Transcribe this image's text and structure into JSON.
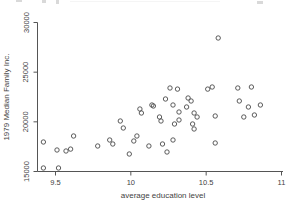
{
  "chart_data": {
    "type": "scatter",
    "title": "",
    "xlabel": "average education level",
    "ylabel": "1979 Median Family Inc.",
    "xlim": [
      9.5,
      11
    ],
    "ylim": [
      15000,
      30000
    ],
    "x_ticks": [
      9.5,
      10,
      10.5,
      11
    ],
    "x_tick_labels": [
      "9.5",
      "10",
      "10.5",
      "11"
    ],
    "y_ticks": [
      15000,
      20000,
      25000,
      30000
    ],
    "y_tick_labels": [
      "15000",
      "20000",
      "25000",
      "30000"
    ],
    "grid": false,
    "legend": null,
    "marker": "open-circle",
    "points": [
      [
        9.42,
        17970
      ],
      [
        9.42,
        15350
      ],
      [
        9.51,
        17160
      ],
      [
        9.52,
        15350
      ],
      [
        9.57,
        17060
      ],
      [
        9.6,
        17260
      ],
      [
        9.62,
        18570
      ],
      [
        9.78,
        17570
      ],
      [
        9.86,
        18170
      ],
      [
        9.88,
        17770
      ],
      [
        9.93,
        20080
      ],
      [
        9.95,
        19380
      ],
      [
        9.99,
        16760
      ],
      [
        10.02,
        18070
      ],
      [
        10.04,
        18570
      ],
      [
        10.06,
        21290
      ],
      [
        10.07,
        20890
      ],
      [
        10.14,
        21690
      ],
      [
        10.15,
        21590
      ],
      [
        10.19,
        20490
      ],
      [
        10.2,
        20080
      ],
      [
        10.23,
        22300
      ],
      [
        10.26,
        23410
      ],
      [
        10.28,
        21690
      ],
      [
        10.29,
        19780
      ],
      [
        10.31,
        23300
      ],
      [
        10.37,
        21490
      ],
      [
        10.32,
        20990
      ],
      [
        10.32,
        20180
      ],
      [
        10.38,
        22400
      ],
      [
        10.4,
        22100
      ],
      [
        10.42,
        20890
      ],
      [
        10.44,
        20490
      ],
      [
        10.41,
        19780
      ],
      [
        10.42,
        19280
      ],
      [
        10.12,
        17570
      ],
      [
        10.21,
        17770
      ],
      [
        10.28,
        18170
      ],
      [
        10.24,
        16960
      ],
      [
        10.51,
        23300
      ],
      [
        10.54,
        23510
      ],
      [
        10.56,
        20590
      ],
      [
        10.58,
        28440
      ],
      [
        10.71,
        23410
      ],
      [
        10.8,
        23510
      ],
      [
        10.72,
        22100
      ],
      [
        10.78,
        21490
      ],
      [
        10.86,
        21690
      ],
      [
        10.75,
        20490
      ],
      [
        10.82,
        20690
      ],
      [
        10.56,
        17870
      ]
    ]
  },
  "colors": {
    "background": "#ffffff",
    "marker_stroke": "#4a4a4a",
    "axis": "#555555",
    "text": "#3f3f3f"
  }
}
